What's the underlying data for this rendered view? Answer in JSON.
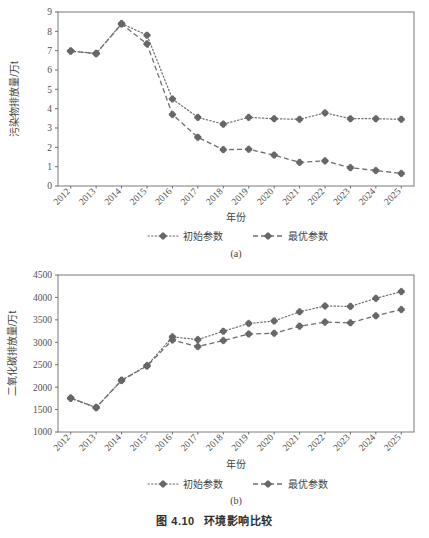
{
  "figure": {
    "caption_number": "图 4.10",
    "caption_text": "环境影响比较",
    "panel_a_label": "(a)",
    "panel_b_label": "(b)"
  },
  "legend": {
    "series1_label": "初始参数",
    "series2_label": "最优参数"
  },
  "colors": {
    "series1": "#6e6e6e",
    "series2": "#6e6e6e",
    "marker": "#6b6b6b",
    "axis": "#6b6b6b",
    "text": "#4f4f4f"
  },
  "chart_data": [
    {
      "type": "line",
      "panel": "(a)",
      "title": "",
      "xlabel": "年份",
      "ylabel": "污染物排放量/万t",
      "categories": [
        "2012",
        "2013",
        "2014",
        "2015",
        "2016",
        "2017",
        "2018",
        "2019",
        "2020",
        "2021",
        "2022",
        "2023",
        "2024",
        "2025"
      ],
      "ylim": [
        0,
        9
      ],
      "yticks": [
        0,
        1,
        2,
        3,
        4,
        5,
        6,
        7,
        8,
        9
      ],
      "grid": false,
      "legend_position": "bottom",
      "series": [
        {
          "name": "初始参数",
          "style": "dotted",
          "values": [
            6.98,
            6.85,
            8.4,
            7.8,
            4.5,
            3.55,
            3.2,
            3.55,
            3.48,
            3.45,
            3.78,
            3.48,
            3.48,
            3.45
          ]
        },
        {
          "name": "最优参数",
          "style": "dashed",
          "values": [
            6.98,
            6.85,
            8.38,
            7.35,
            3.7,
            2.52,
            1.88,
            1.9,
            1.6,
            1.22,
            1.3,
            0.95,
            0.8,
            0.65
          ]
        }
      ]
    },
    {
      "type": "line",
      "panel": "(b)",
      "title": "",
      "xlabel": "年份",
      "ylabel": "二氧化碳排放量/万t",
      "categories": [
        "2012",
        "2013",
        "2014",
        "2015",
        "2016",
        "2017",
        "2018",
        "2019",
        "2020",
        "2021",
        "2022",
        "2023",
        "2024",
        "2025"
      ],
      "ylim": [
        1000,
        4500
      ],
      "yticks": [
        1000,
        1500,
        2000,
        2500,
        3000,
        3500,
        4000,
        4500
      ],
      "grid": false,
      "legend_position": "bottom",
      "series": [
        {
          "name": "初始参数",
          "style": "dotted",
          "values": [
            1755,
            1545,
            2155,
            2480,
            3120,
            3060,
            3245,
            3420,
            3475,
            3680,
            3810,
            3800,
            3980,
            4130
          ]
        },
        {
          "name": "最优参数",
          "style": "dashed",
          "values": [
            1755,
            1545,
            2150,
            2470,
            3050,
            2905,
            3040,
            3185,
            3200,
            3360,
            3450,
            3435,
            3590,
            3730
          ]
        }
      ]
    }
  ]
}
